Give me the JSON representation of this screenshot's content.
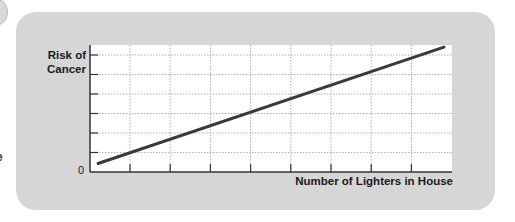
{
  "chart_data": {
    "type": "line",
    "title": "",
    "xlabel": "Number of Lighters in House",
    "ylabel": "Risk of Cancer",
    "ylabel_lines": [
      "Risk of",
      "Cancer"
    ],
    "origin_label": "0",
    "x": [
      0.2,
      8.8
    ],
    "series": [
      {
        "name": "Risk of Cancer",
        "values": [
          0.4,
          5.9
        ],
        "color": "#3a3a3a"
      }
    ],
    "xlim": [
      0,
      9
    ],
    "ylim": [
      0,
      6
    ],
    "x_ticks": 8,
    "y_ticks": 6,
    "grid": true,
    "grid_style": "dotted",
    "legend": null
  },
  "colors": {
    "panel": "#d6d6d6",
    "plot_bg": "#ffffff",
    "line": "#3a3a3a",
    "axis": "#333333",
    "grid": "#b0b0b0"
  },
  "fragments": {
    "left_edge_glyph": "e"
  }
}
